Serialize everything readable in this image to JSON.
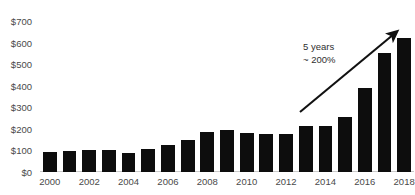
{
  "chart_data": {
    "type": "bar",
    "title": "",
    "xlabel": "",
    "ylabel": "",
    "ylim": [
      0,
      700
    ],
    "ytick_step": 100,
    "ytick_labels": [
      "$0",
      "$100",
      "$200",
      "$300",
      "$400",
      "$500",
      "$600",
      "$700"
    ],
    "ytick_values": [
      0,
      100,
      200,
      300,
      400,
      500,
      600,
      700
    ],
    "grid": false,
    "legend": "none",
    "bar_color": "#0d0d0d",
    "categories": [
      "2000",
      "2001",
      "2002",
      "2003",
      "2004",
      "2005",
      "2006",
      "2007",
      "2008",
      "2009",
      "2010",
      "2011",
      "2012",
      "2013",
      "2014",
      "2015",
      "2016",
      "2017",
      "2018"
    ],
    "values": [
      95,
      97,
      100,
      100,
      90,
      105,
      125,
      150,
      185,
      195,
      180,
      178,
      175,
      215,
      215,
      255,
      390,
      550,
      620
    ],
    "xtick_labels": [
      "2000",
      "2002",
      "2004",
      "2006",
      "2008",
      "2010",
      "2012",
      "2014",
      "2016",
      "2018"
    ],
    "xtick_categories": [
      "2000",
      "2002",
      "2004",
      "2006",
      "2008",
      "2010",
      "2012",
      "2014",
      "2016",
      "2018"
    ],
    "annotations": [
      {
        "name": "growth-callout",
        "line1": "5 years",
        "line2": "~ 200%",
        "arrow": "diagonal-up-right"
      }
    ]
  },
  "title_clipped": {
    "text": ""
  }
}
